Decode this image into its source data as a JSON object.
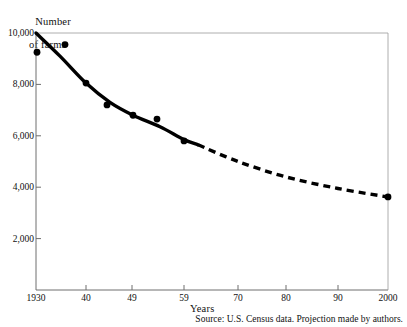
{
  "chart_data": {
    "type": "line",
    "title": "",
    "subtitle": "",
    "ylabel_line1": "Number",
    "ylabel_line2": "of farms",
    "xlabel": "Years",
    "source_note": "Source: U.S. Census data. Projection made by authors.",
    "grid": false,
    "legend": "none",
    "ylim": [
      0,
      10000
    ],
    "y_ticks": [
      {
        "label": "10,000",
        "value": 10000
      },
      {
        "label": "8,000",
        "value": 8000
      },
      {
        "label": "6,000",
        "value": 6000
      },
      {
        "label": "4,000",
        "value": 4000
      },
      {
        "label": "2,000",
        "value": 2000
      }
    ],
    "x_ticks": [
      {
        "label": "1930",
        "value": 1930,
        "px": 36
      },
      {
        "label": "40",
        "value": 1940,
        "px": 86
      },
      {
        "label": "49",
        "value": 1949,
        "px": 132
      },
      {
        "label": "59",
        "value": 1959,
        "px": 184
      },
      {
        "label": "70",
        "value": 1970,
        "px": 238
      },
      {
        "label": "80",
        "value": 1980,
        "px": 286
      },
      {
        "label": "90",
        "value": 1990,
        "px": 338
      },
      {
        "label": "2000",
        "value": 2000,
        "px": 388
      }
    ],
    "series": [
      {
        "name": "Observed farms",
        "style": "solid-curve",
        "points": [
          {
            "x_px": 36,
            "value": 10000
          },
          {
            "x_px": 60,
            "value": 9100
          },
          {
            "x_px": 86,
            "value": 8050
          },
          {
            "x_px": 110,
            "value": 7300
          },
          {
            "x_px": 133,
            "value": 6800
          },
          {
            "x_px": 160,
            "value": 6350
          },
          {
            "x_px": 184,
            "value": 5850
          },
          {
            "x_px": 198,
            "value": 5650
          }
        ]
      },
      {
        "name": "Projected farms",
        "style": "dashed-curve",
        "points": [
          {
            "x_px": 198,
            "value": 5650
          },
          {
            "x_px": 238,
            "value": 5000
          },
          {
            "x_px": 286,
            "value": 4400
          },
          {
            "x_px": 338,
            "value": 3950
          },
          {
            "x_px": 388,
            "value": 3620
          }
        ]
      }
    ],
    "data_points": [
      {
        "x_px": 37,
        "value": 9250
      },
      {
        "x_px": 65,
        "value": 9550
      },
      {
        "x_px": 86,
        "value": 8050
      },
      {
        "x_px": 107,
        "value": 7200
      },
      {
        "x_px": 133,
        "value": 6800
      },
      {
        "x_px": 157,
        "value": 6650
      },
      {
        "x_px": 184,
        "value": 5800
      },
      {
        "x_px": 388,
        "value": 3620
      }
    ]
  }
}
